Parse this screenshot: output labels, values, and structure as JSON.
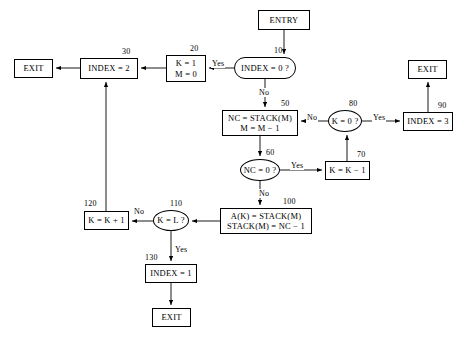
{
  "diagram": {
    "background": "#ffffff",
    "stroke": "#000000",
    "nodes": [
      {
        "id": "entry",
        "shape": "rect",
        "lines": [
          "ENTRY"
        ],
        "step": "",
        "x": 258,
        "y": 10,
        "w": 52,
        "h": 20
      },
      {
        "id": "n10",
        "shape": "stadium",
        "lines": [
          "INDEX = 0 ?"
        ],
        "step": "10",
        "x": 234,
        "y": 57,
        "w": 62,
        "h": 22
      },
      {
        "id": "n20",
        "shape": "rect",
        "lines": [
          "K = 1",
          "M = 0"
        ],
        "step": "20",
        "x": 166,
        "y": 55,
        "w": 40,
        "h": 27
      },
      {
        "id": "n30",
        "shape": "rect",
        "lines": [
          "INDEX = 2"
        ],
        "step": "30",
        "x": 80,
        "y": 58,
        "w": 58,
        "h": 21
      },
      {
        "id": "exitL",
        "shape": "rect",
        "lines": [
          "EXIT"
        ],
        "step": "",
        "x": 14,
        "y": 59,
        "w": 39,
        "h": 19
      },
      {
        "id": "n50",
        "shape": "rect",
        "lines": [
          "NC = STACK(M)",
          "M = M − 1"
        ],
        "step": "50",
        "x": 222,
        "y": 110,
        "w": 76,
        "h": 26
      },
      {
        "id": "n80",
        "shape": "ellipse",
        "lines": [
          "K = 0 ?"
        ],
        "step": "80",
        "x": 328,
        "y": 110,
        "w": 34,
        "h": 22
      },
      {
        "id": "n90",
        "shape": "rect",
        "lines": [
          "INDEX = 3"
        ],
        "step": "90",
        "x": 403,
        "y": 112,
        "w": 50,
        "h": 19
      },
      {
        "id": "exitR",
        "shape": "rect",
        "lines": [
          "EXIT"
        ],
        "step": "",
        "x": 408,
        "y": 60,
        "w": 39,
        "h": 19
      },
      {
        "id": "n60",
        "shape": "ellipse",
        "lines": [
          "NC = 0 ?"
        ],
        "step": "60",
        "x": 240,
        "y": 159,
        "w": 40,
        "h": 22
      },
      {
        "id": "n70",
        "shape": "rect",
        "lines": [
          "K = K − 1"
        ],
        "step": "70",
        "x": 325,
        "y": 161,
        "w": 45,
        "h": 19
      },
      {
        "id": "n100",
        "shape": "rect",
        "lines": [
          "A(K) = STACK(M)",
          "STACK(M) = NC − 1"
        ],
        "step": "100",
        "x": 220,
        "y": 208,
        "w": 92,
        "h": 26
      },
      {
        "id": "n110",
        "shape": "ellipse",
        "lines": [
          "K = L ?"
        ],
        "step": "110",
        "x": 153,
        "y": 210,
        "w": 36,
        "h": 21
      },
      {
        "id": "n120",
        "shape": "rect",
        "lines": [
          "K = K + 1"
        ],
        "step": "120",
        "x": 84,
        "y": 211,
        "w": 45,
        "h": 19
      },
      {
        "id": "n130",
        "shape": "rect",
        "lines": [
          "INDEX = 1"
        ],
        "step": "130",
        "x": 145,
        "y": 264,
        "w": 52,
        "h": 19
      },
      {
        "id": "exitB",
        "shape": "rect",
        "lines": [
          "EXIT"
        ],
        "step": "",
        "x": 152,
        "y": 308,
        "w": 39,
        "h": 19
      }
    ],
    "step_labels": [
      {
        "text": "10",
        "x": 274,
        "y": 46
      },
      {
        "text": "20",
        "x": 190,
        "y": 44
      },
      {
        "text": "30",
        "x": 122,
        "y": 47
      },
      {
        "text": "50",
        "x": 281,
        "y": 99
      },
      {
        "text": "80",
        "x": 349,
        "y": 99
      },
      {
        "text": "90",
        "x": 438,
        "y": 101
      },
      {
        "text": "60",
        "x": 266,
        "y": 148
      },
      {
        "text": "70",
        "x": 357,
        "y": 150
      },
      {
        "text": "100",
        "x": 283,
        "y": 197
      },
      {
        "text": "110",
        "x": 170,
        "y": 199
      },
      {
        "text": "120",
        "x": 84,
        "y": 199
      },
      {
        "text": "130",
        "x": 145,
        "y": 253
      }
    ],
    "edge_labels": [
      {
        "text": "Yes",
        "x": 211,
        "y": 59
      },
      {
        "text": "No",
        "x": 258,
        "y": 88
      },
      {
        "text": "No",
        "x": 306,
        "y": 113
      },
      {
        "text": "Yes",
        "x": 372,
        "y": 113
      },
      {
        "text": "Yes",
        "x": 290,
        "y": 161
      },
      {
        "text": "No",
        "x": 258,
        "y": 189
      },
      {
        "text": "No",
        "x": 133,
        "y": 207
      },
      {
        "text": "Yes",
        "x": 174,
        "y": 245
      }
    ]
  }
}
